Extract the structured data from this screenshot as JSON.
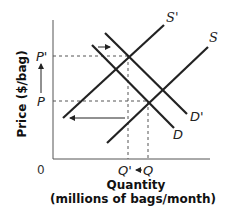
{
  "diagram": {
    "type": "supply-demand-shift",
    "y_axis": {
      "title": "Price ($/bag)",
      "ticks": [
        "P'",
        "P"
      ]
    },
    "x_axis": {
      "title": "Quantity",
      "subtitle": "(millions of bags/month)",
      "ticks": [
        "Q'",
        "Q"
      ]
    },
    "origin_label": "0",
    "curves": {
      "supply_original": "S",
      "supply_shifted": "S'",
      "demand_original": "D",
      "demand_shifted": "D'"
    },
    "colors": {
      "line": "#222222",
      "dashed": "#555555",
      "text": "#222222"
    }
  }
}
